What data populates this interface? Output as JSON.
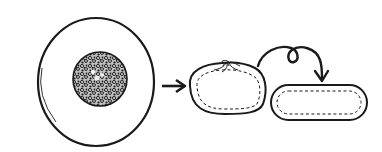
{
  "diagram": {
    "description": "Step illustration: filling ball placed on a round dough wrapper, gathered into a pleated bun, then flattened into an oval",
    "colors": {
      "ink": "#1a1a1a",
      "background": "#ffffff",
      "filling_fill": "#3a3a3a"
    },
    "steps": [
      {
        "id": "step-1",
        "label": "Round wrapper with filling ball in center"
      },
      {
        "id": "step-2",
        "label": "Gathered pleated bun"
      },
      {
        "id": "step-3",
        "label": "Flattened oval bun"
      }
    ],
    "arrows": [
      {
        "id": "arrow-1",
        "type": "straight-arrow",
        "from": "step-1",
        "to": "step-2"
      },
      {
        "id": "arrow-2",
        "type": "looped-arrow",
        "from": "step-2",
        "to": "step-3"
      }
    ]
  }
}
